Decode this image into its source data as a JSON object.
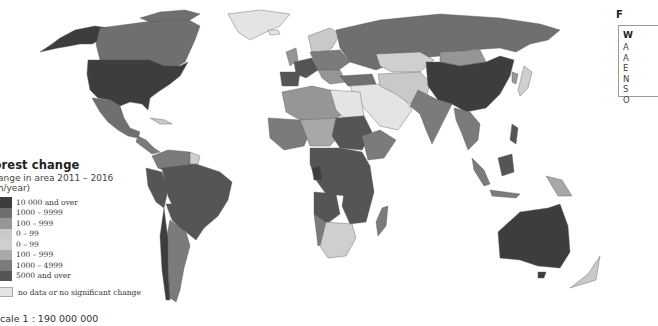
{
  "map": {
    "type": "choropleth",
    "subject": "Forest change",
    "projection": "world",
    "colors": {
      "gain_10000_plus": "#3d3d3d",
      "gain_1000_9999": "#6f6f6f",
      "gain_100_999": "#969696",
      "gain_0_99": "#c9c9c9",
      "loss_0_99": "#cfcfcf",
      "loss_100_999": "#a8a8a8",
      "loss_1000_4999": "#7b7b7b",
      "loss_5000_plus": "#555555",
      "no_data": "#e4e4e4",
      "ocean": "#ffffff",
      "border": "#444444"
    }
  },
  "legend": {
    "title": "Forest change",
    "subtitle_line1": "Change in area 2011 – 2016",
    "subtitle_line2": "(km/year)",
    "items": [
      {
        "label": "10 000 and over",
        "color": "#3d3d3d"
      },
      {
        "label": "1000 – 9999",
        "color": "#6f6f6f"
      },
      {
        "label": "100 – 999",
        "color": "#969696"
      },
      {
        "label": "0 – 99",
        "color": "#c9c9c9"
      },
      {
        "label": "0 – 99",
        "color": "#cfcfcf"
      },
      {
        "label": "100 – 999",
        "color": "#a8a8a8"
      },
      {
        "label": "1000 – 4999",
        "color": "#7b7b7b"
      },
      {
        "label": "5000 and over",
        "color": "#555555"
      }
    ],
    "no_data": {
      "label": "no data or no significant change",
      "color": "#e4e4e4"
    }
  },
  "scale": {
    "text": "Scale 1 : 190 000 000"
  },
  "side_panel": {
    "title": "F",
    "header": "W",
    "items": [
      "A",
      "A",
      "E",
      "N",
      "S",
      "O"
    ]
  }
}
